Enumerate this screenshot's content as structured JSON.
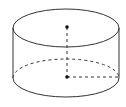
{
  "diagram": {
    "type": "cylinder",
    "stroke_color": "#333333",
    "dot_color": "#111111",
    "background": "#ffffff",
    "geometry": {
      "center_x": 66,
      "top_center_y": 28,
      "bottom_center_y": 78,
      "rx": 53,
      "ry": 19
    },
    "points": [
      {
        "name": "top-center",
        "x": 67,
        "y": 27
      },
      {
        "name": "bottom-center",
        "x": 67,
        "y": 77
      }
    ],
    "elements": [
      {
        "name": "top-ellipse",
        "style": "solid"
      },
      {
        "name": "left-side",
        "style": "solid"
      },
      {
        "name": "right-side",
        "style": "solid"
      },
      {
        "name": "bottom-front-arc",
        "style": "solid"
      },
      {
        "name": "bottom-back-arc",
        "style": "dashed"
      },
      {
        "name": "axis",
        "style": "dashed"
      },
      {
        "name": "bottom-radius",
        "style": "dashed"
      }
    ]
  }
}
